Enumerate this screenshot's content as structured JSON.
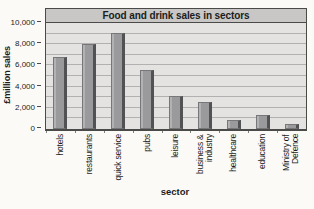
{
  "chart_data": {
    "type": "bar",
    "title": "Food and drink sales in sectors",
    "xlabel": "sector",
    "ylabel": "£million sales",
    "categories": [
      "hotels",
      "restaurants",
      "quick service",
      "pubs",
      "leisure",
      "business & industry",
      "healthcare",
      "education",
      "Ministry of Defence"
    ],
    "values": [
      6600,
      7800,
      8900,
      5400,
      2900,
      2400,
      700,
      1100,
      250
    ],
    "ylim": [
      0,
      10000
    ],
    "ytick_values": [
      0,
      2000,
      4000,
      6000,
      8000,
      10000
    ],
    "ytick_labels": [
      "0",
      "2,000",
      "4,000",
      "6,000",
      "8,000",
      "10,000"
    ],
    "gridline_interval": 1000,
    "grid": "horizontal",
    "legend": "none",
    "colors": {
      "page_bg": "#fbfaf7",
      "plot_bg": "#e4e3e1",
      "title_band_bg": "#c8c7c5",
      "gridline": "#b2b1af",
      "frame": "#4a4a48",
      "bar_fill": "#9a9a9c",
      "bar_highlight": "#b2b2b4",
      "bar_edge": "#77777a",
      "bar_shadow": "#525255",
      "text": "#1c1c1c"
    }
  }
}
